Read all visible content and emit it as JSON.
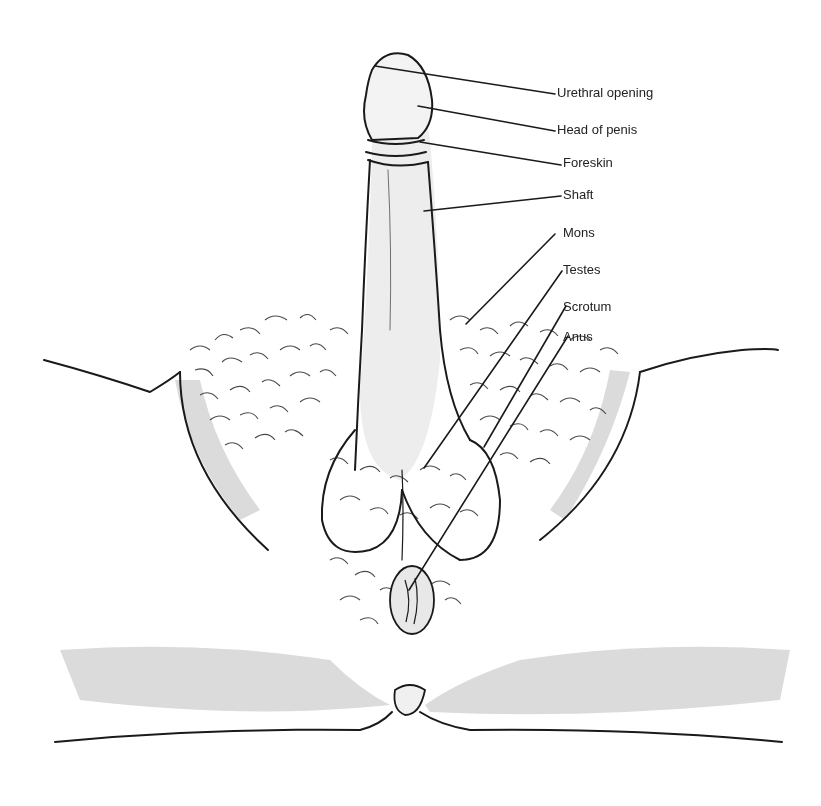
{
  "diagram": {
    "background_color": "#ffffff",
    "ink_color": "#1a1a1a",
    "shading_color": "#c8c8c8",
    "labels": [
      {
        "id": "urethral-opening",
        "text": "Urethral opening",
        "x": 557,
        "y": 87,
        "line": [
          375,
          66,
          555,
          94
        ]
      },
      {
        "id": "head-of-penis",
        "text": "Head of penis",
        "x": 557,
        "y": 124,
        "line": [
          418,
          106,
          555,
          131
        ]
      },
      {
        "id": "foreskin",
        "text": "Foreskin",
        "x": 563,
        "y": 157,
        "line": [
          420,
          142,
          561,
          165
        ]
      },
      {
        "id": "shaft",
        "text": "Shaft",
        "x": 563,
        "y": 189,
        "line": [
          424,
          211,
          561,
          196
        ]
      },
      {
        "id": "mons",
        "text": "Mons",
        "x": 563,
        "y": 227,
        "line": [
          466,
          324,
          555,
          234
        ]
      },
      {
        "id": "testes",
        "text": "Testes",
        "x": 563,
        "y": 264,
        "line": [
          424,
          468,
          562,
          271
        ]
      },
      {
        "id": "scrotum",
        "text": "Scrotum",
        "x": 563,
        "y": 301,
        "line": [
          484,
          447,
          566,
          306
        ]
      },
      {
        "id": "anus",
        "text": "Anus",
        "x": 563,
        "y": 331,
        "line": [
          409,
          590,
          568,
          336
        ]
      }
    ]
  }
}
